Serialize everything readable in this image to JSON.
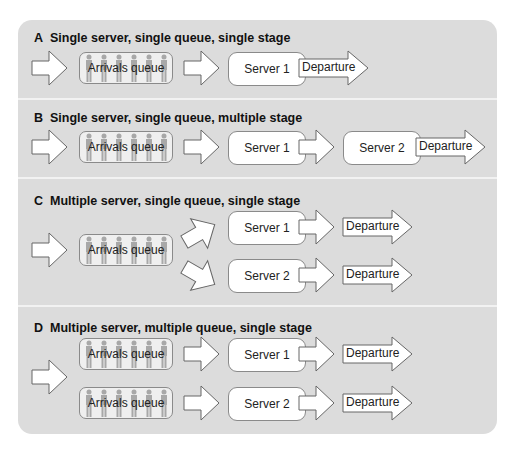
{
  "diagram": {
    "colors": {
      "panel_background": "#dcdcdc",
      "divider": "#f2f2f2",
      "box_fill": "#ffffff",
      "queue_fill": "#efefef",
      "people_icons": "#a8a8a8",
      "outline": "#8a8a8a"
    },
    "sections": [
      {
        "letter": "A",
        "title": "Single server, single queue, single stage",
        "queues": [
          "Arrivals queue"
        ],
        "servers": [
          "Server 1"
        ],
        "departures": [
          "Departure"
        ]
      },
      {
        "letter": "B",
        "title": "Single server, single queue, multiple stage",
        "queues": [
          "Arrivals queue"
        ],
        "servers": [
          "Server 1",
          "Server 2"
        ],
        "departures": [
          "Departure"
        ]
      },
      {
        "letter": "C",
        "title": "Multiple server, single queue, single stage",
        "queues": [
          "Arrivals queue"
        ],
        "servers": [
          "Server 1",
          "Server 2"
        ],
        "departures": [
          "Departure",
          "Departure"
        ]
      },
      {
        "letter": "D",
        "title": "Multiple server, multiple queue, single stage",
        "queues": [
          "Arrivals queue",
          "Arrivals queue"
        ],
        "servers": [
          "Server 1",
          "Server 2"
        ],
        "departures": [
          "Departure",
          "Departure"
        ]
      }
    ]
  }
}
